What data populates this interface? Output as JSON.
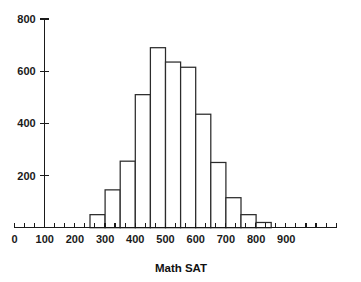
{
  "chart_data": {
    "type": "bar",
    "title": "",
    "subtitle": "",
    "xlabel": "Math SAT",
    "ylabel": "",
    "xlim": [
      0,
      1000
    ],
    "ylim": [
      0,
      800
    ],
    "grid": false,
    "legend": null,
    "bin_width": 50,
    "x_tick_labels": [
      "0",
      "100",
      "200",
      "300",
      "400",
      "500",
      "600",
      "700",
      "800",
      "900"
    ],
    "x_tick_values": [
      0,
      100,
      200,
      300,
      400,
      500,
      600,
      700,
      800,
      900
    ],
    "y_tick_labels": [
      "200",
      "400",
      "600",
      "800"
    ],
    "y_tick_values": [
      200,
      400,
      600,
      800
    ],
    "x_minor_tick_step": 33.3,
    "categories": [
      "200-250",
      "250-300",
      "300-350",
      "350-400",
      "400-450",
      "450-500",
      "500-550",
      "550-600",
      "600-650",
      "650-700",
      "700-750",
      "750-800",
      "800-850"
    ],
    "bin_edges": [
      200,
      250,
      300,
      350,
      400,
      450,
      500,
      550,
      600,
      650,
      700,
      750,
      800,
      850
    ],
    "values": [
      0,
      50,
      145,
      255,
      510,
      690,
      635,
      615,
      435,
      250,
      115,
      50,
      20
    ],
    "colors": {
      "bar_fill": "#ffffff",
      "bar_stroke": "#2b2b2b",
      "axis": "#1a1a1a",
      "text": "#111111",
      "background": "#ffffff"
    }
  }
}
